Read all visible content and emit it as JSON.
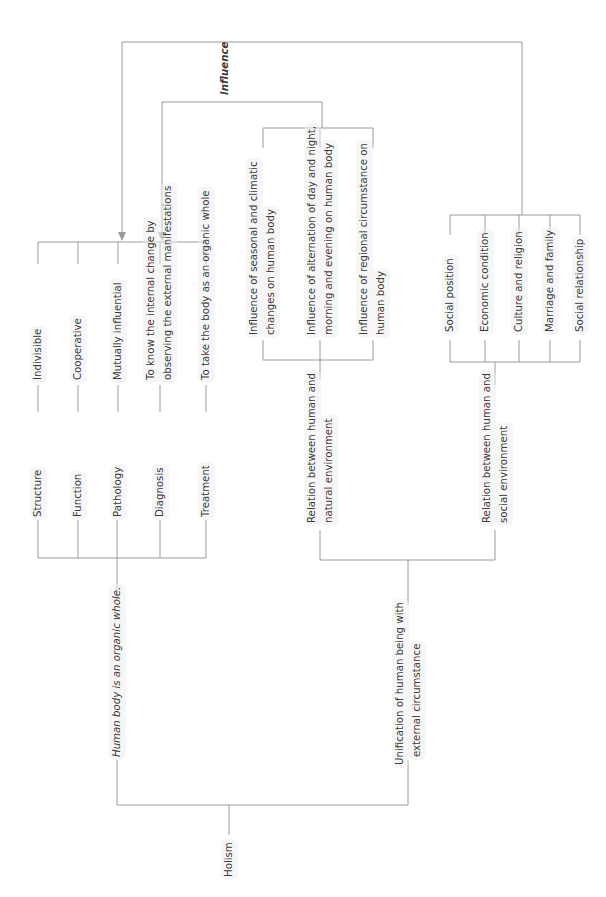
{
  "diagram": {
    "root": "Holism",
    "influence_label": "Influence",
    "left_branch": {
      "title": "Human body is an organic whole.",
      "items": [
        {
          "aspect": "Structure",
          "value": "Indivisible"
        },
        {
          "aspect": "Function",
          "value": "Cooperative"
        },
        {
          "aspect": "Pathology",
          "value": "Mutually influential"
        },
        {
          "aspect": "Diagnosis",
          "value_line1": "To know the internal change by",
          "value_line2": "observing the external manifestations"
        },
        {
          "aspect": "Treatment",
          "value": "To take the body as an organic whole"
        }
      ]
    },
    "right_branch": {
      "title_line1": "Unification of human being with",
      "title_line2": "external circumstance",
      "natural": {
        "title_line1": "Relation between human and",
        "title_line2": "natural environment",
        "items": [
          {
            "line1": "Influence of seasonal and climatic",
            "line2": "changes on human body"
          },
          {
            "line1": "Influence of alternation of day and night,",
            "line2": "morning and evening on human body"
          },
          {
            "line1": "Influence of regional circumstance on",
            "line2": "human body"
          }
        ]
      },
      "social": {
        "title_line1": "Relation between human and",
        "title_line2": "social environment",
        "items": [
          "Social position",
          "Economic condition",
          "Culture and religion",
          "Marriage and family",
          "Social relationship"
        ]
      }
    },
    "colors": {
      "line": "#9a9a9a",
      "text": "#3a3a3a",
      "label_bg": "#eeeeee"
    }
  }
}
